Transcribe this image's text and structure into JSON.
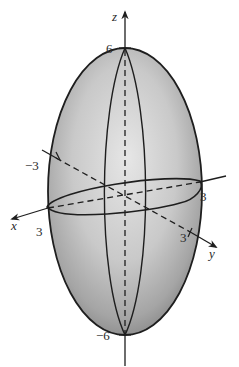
{
  "figure": {
    "type": "ellipsoid",
    "colors": {
      "background": "#ffffff",
      "surface_light": "#e2e2e2",
      "surface_mid": "#bdbdbd",
      "surface_dark": "#8f8f8f",
      "stroke": "#1e1e1e"
    },
    "axes": {
      "x": {
        "label": "x",
        "tick_positive": "3"
      },
      "y": {
        "label": "y",
        "tick_positive": "3",
        "tick_negative": "−3"
      },
      "z": {
        "label": "z",
        "tick_positive": "6",
        "tick_negative": "−6"
      }
    },
    "equator_tick_right": "3"
  }
}
